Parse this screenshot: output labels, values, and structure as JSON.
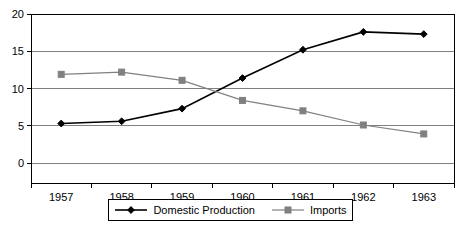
{
  "chart_data": {
    "type": "line",
    "title": "",
    "subtitle": "",
    "xlabel": "",
    "ylabel": "",
    "categories": [
      "1957",
      "1958",
      "1959",
      "1960",
      "1961",
      "1962",
      "1963"
    ],
    "series": [
      {
        "name": "Domestic Production",
        "color": "#000000",
        "marker": "diamond",
        "values": [
          5.3,
          5.6,
          7.3,
          11.4,
          15.2,
          17.6,
          17.3
        ]
      },
      {
        "name": "Imports",
        "color": "#808080",
        "marker": "square",
        "values": [
          11.9,
          12.2,
          11.1,
          8.4,
          7.0,
          5.1,
          3.9
        ]
      }
    ],
    "ylim": [
      0,
      20
    ],
    "yticks": [
      0,
      5,
      10,
      15,
      20
    ],
    "ytick_labels": [
      "0",
      "5",
      "10",
      "15",
      "20"
    ],
    "grid": "horizontal",
    "legend_position": "bottom",
    "plot_background": "#ffffff",
    "gridline_color": "#808080",
    "axis_color": "#000000"
  }
}
